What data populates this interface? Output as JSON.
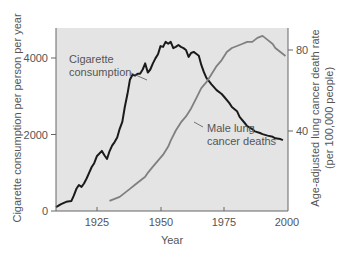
{
  "chart_data": {
    "type": "line",
    "title": "",
    "xlabel": "Year",
    "ylabel_left": "Cigarette consumption per person per year",
    "ylabel_right": "Age-adjusted lung cancer death rate (per 100,000 people)",
    "ylabel_right_line1": "Age-adjusted lung cancer death rate",
    "ylabel_right_line2": "(per 100,000 people)",
    "xlim": [
      1909,
      2000
    ],
    "ylim_left": [
      0,
      4800
    ],
    "ylim_right": [
      0,
      90
    ],
    "x_ticks": [
      "1925",
      "1950",
      "1975",
      "2000"
    ],
    "y_left_ticks": [
      "0",
      "2000",
      "4000"
    ],
    "y_right_ticks": [
      "40",
      "80"
    ],
    "grid": false,
    "series": [
      {
        "name": "Cigarette consumption",
        "label_line1": "Cigarette",
        "label_line2": "consumption",
        "axis": "left",
        "color": "#1a1a1a",
        "x": [
          1909,
          1911,
          1913,
          1915,
          1916,
          1917,
          1918,
          1919,
          1920,
          1921,
          1922,
          1923,
          1924,
          1925,
          1927,
          1928,
          1929,
          1930,
          1931,
          1932,
          1933,
          1934,
          1935,
          1936,
          1937,
          1938,
          1939,
          1940,
          1941,
          1942,
          1943,
          1944,
          1945,
          1946,
          1947,
          1948,
          1949,
          1950,
          1951,
          1952,
          1953,
          1954,
          1955,
          1956,
          1957,
          1958,
          1959,
          1960,
          1961,
          1962,
          1963,
          1964,
          1965,
          1966,
          1967,
          1968,
          1970,
          1972,
          1974,
          1975,
          1977,
          1978,
          1980,
          1981,
          1983,
          1984,
          1986,
          1987,
          1989,
          1990,
          1992,
          1994,
          1995,
          1997,
          1998
        ],
        "values": [
          100,
          180,
          240,
          260,
          400,
          580,
          680,
          630,
          720,
          850,
          1000,
          1150,
          1250,
          1430,
          1570,
          1460,
          1360,
          1560,
          1710,
          1800,
          1920,
          2150,
          2330,
          2720,
          3050,
          3430,
          3560,
          3540,
          3590,
          3590,
          3700,
          3860,
          3620,
          3700,
          3860,
          3990,
          4100,
          4310,
          4290,
          4420,
          4370,
          4420,
          4260,
          4290,
          4340,
          4290,
          4260,
          4210,
          4030,
          4130,
          4160,
          4110,
          4060,
          3820,
          3630,
          3480,
          3310,
          3160,
          3060,
          2980,
          2820,
          2720,
          2610,
          2460,
          2300,
          2220,
          2140,
          2080,
          2040,
          2010,
          1970,
          1940,
          1900,
          1880,
          1850
        ]
      },
      {
        "name": "Male lung cancer deaths",
        "label_line1": "Male lung",
        "label_line2": "cancer deaths",
        "axis": "right",
        "color": "#808080",
        "x": [
          1930,
          1932,
          1934,
          1936,
          1938,
          1940,
          1942,
          1944,
          1945,
          1947,
          1949,
          1951,
          1953,
          1954,
          1956,
          1958,
          1960,
          1962,
          1964,
          1966,
          1968,
          1970,
          1972,
          1974,
          1976,
          1978,
          1980,
          1982,
          1984,
          1986,
          1988,
          1990,
          1991,
          1992,
          1994,
          1995,
          1997,
          1999
        ],
        "values": [
          5,
          6,
          7,
          9,
          11,
          13,
          15,
          17,
          19,
          22,
          25,
          28,
          32,
          35,
          40,
          44,
          47,
          51,
          56,
          61,
          64,
          68,
          72,
          75,
          79,
          81,
          82,
          83,
          84,
          84,
          86,
          87,
          86,
          85,
          83,
          81,
          79,
          77
        ]
      }
    ]
  }
}
